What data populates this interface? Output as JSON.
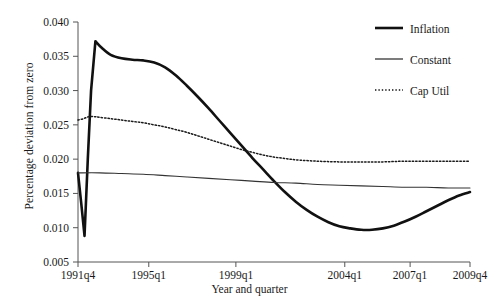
{
  "chart_data": {
    "type": "line",
    "title": "",
    "xlabel": "Year and quarter",
    "ylabel": "Percentage deviation from zero",
    "ylim": [
      0.005,
      0.04
    ],
    "yticks": [
      "0.040",
      "0.035",
      "0.030",
      "0.025",
      "0.020",
      "0.015",
      "0.010",
      "0.005"
    ],
    "ytick_values": [
      0.04,
      0.035,
      0.03,
      0.025,
      0.02,
      0.015,
      0.01,
      0.005
    ],
    "xticks": [
      "1991q4",
      "1995q1",
      "1999q1",
      "2004q1",
      "2007q1",
      "2009q4"
    ],
    "xtick_positions": [
      0,
      13,
      29,
      49,
      61,
      72
    ],
    "xlim": [
      0,
      72
    ],
    "grid": false,
    "legend_position": "top-right",
    "series": [
      {
        "name": "Inflation",
        "style": "solid-thick",
        "color": "#111111",
        "x": [
          0,
          0.6,
          1.2,
          1.8,
          2.4,
          3.2,
          4.4,
          6,
          8,
          10,
          12,
          14,
          16,
          18,
          20,
          22,
          24,
          26,
          28,
          30,
          32,
          34,
          36,
          38,
          40,
          42,
          44,
          46,
          48,
          50,
          52,
          54,
          56,
          58,
          60,
          62,
          64,
          66,
          68,
          70,
          72
        ],
        "values": [
          0.018,
          0.0135,
          0.0088,
          0.02,
          0.03,
          0.0372,
          0.0362,
          0.0352,
          0.0347,
          0.0345,
          0.0344,
          0.0341,
          0.0334,
          0.0322,
          0.0307,
          0.0291,
          0.0274,
          0.0256,
          0.0238,
          0.022,
          0.0202,
          0.0185,
          0.0168,
          0.0152,
          0.0138,
          0.0126,
          0.0116,
          0.0108,
          0.0102,
          0.0099,
          0.0097,
          0.0097,
          0.0099,
          0.0103,
          0.0109,
          0.0116,
          0.0124,
          0.0132,
          0.014,
          0.0147,
          0.0152
        ]
      },
      {
        "name": "Constant",
        "style": "solid-thin",
        "color": "#333333",
        "x": [
          0,
          4,
          8,
          12,
          16,
          20,
          24,
          28,
          32,
          36,
          40,
          44,
          48,
          52,
          56,
          60,
          64,
          68,
          72
        ],
        "values": [
          0.018,
          0.018,
          0.0179,
          0.0178,
          0.0176,
          0.0174,
          0.0172,
          0.017,
          0.0168,
          0.0166,
          0.0165,
          0.0163,
          0.0162,
          0.0161,
          0.016,
          0.0159,
          0.0159,
          0.0158,
          0.0158
        ]
      },
      {
        "name": "Cap Util",
        "style": "dotted",
        "color": "#1a1a1a",
        "x": [
          0,
          1,
          2,
          3,
          4,
          6,
          8,
          10,
          12,
          14,
          16,
          18,
          20,
          22,
          24,
          26,
          28,
          30,
          32,
          34,
          36,
          38,
          40,
          44,
          48,
          52,
          56,
          60,
          64,
          68,
          72
        ],
        "values": [
          0.0257,
          0.0259,
          0.0262,
          0.0262,
          0.0261,
          0.0259,
          0.0257,
          0.0255,
          0.0253,
          0.025,
          0.0247,
          0.0243,
          0.0239,
          0.0234,
          0.0229,
          0.0224,
          0.0219,
          0.0214,
          0.021,
          0.0206,
          0.0203,
          0.0201,
          0.0199,
          0.0197,
          0.0196,
          0.0196,
          0.0196,
          0.0197,
          0.0197,
          0.0197,
          0.0197
        ]
      }
    ],
    "legend": [
      {
        "label": "Inflation",
        "style": "solid-thick"
      },
      {
        "label": "Constant",
        "style": "solid-thin"
      },
      {
        "label": "Cap Util",
        "style": "dotted"
      }
    ]
  }
}
